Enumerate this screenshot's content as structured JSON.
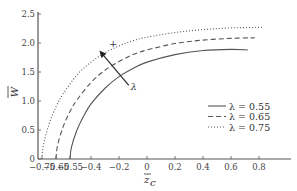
{
  "chart_data": {
    "type": "line",
    "title": "",
    "xlabel": "z̄_c",
    "ylabel": "W̄",
    "xlim": [
      -0.8,
      1.0
    ],
    "ylim": [
      0,
      2.5
    ],
    "x_ticks": [
      -0.75,
      -0.65,
      -0.55,
      -0.4,
      -0.2,
      0,
      0.2,
      0.4,
      0.6,
      0.8
    ],
    "x_tick_labels": [
      "−0.75",
      "−0.65",
      "−0.55",
      "−0.4",
      "−0.2",
      "0",
      "0.2",
      "0.4",
      "0.6",
      "0.8"
    ],
    "y_ticks": [
      0,
      0.5,
      1.0,
      1.5,
      2.0,
      2.5
    ],
    "y_tick_labels": [
      "0",
      "0.5",
      "1.0",
      "1.5",
      "2.0",
      "2.5"
    ],
    "grid": false,
    "legend_position": "lower right",
    "series": [
      {
        "name": "λ = 0.55",
        "style": "solid",
        "x": [
          -0.55,
          -0.54,
          -0.5,
          -0.45,
          -0.4,
          -0.3,
          -0.2,
          -0.1,
          0,
          0.2,
          0.4,
          0.6,
          0.72
        ],
        "y": [
          0,
          0.2,
          0.5,
          0.75,
          0.95,
          1.22,
          1.42,
          1.56,
          1.67,
          1.8,
          1.87,
          1.89,
          1.88
        ]
      },
      {
        "name": "λ = 0.65",
        "style": "dashed",
        "x": [
          -0.65,
          -0.64,
          -0.6,
          -0.55,
          -0.5,
          -0.4,
          -0.3,
          -0.2,
          -0.1,
          0,
          0.2,
          0.4,
          0.6,
          0.77
        ],
        "y": [
          0,
          0.22,
          0.55,
          0.82,
          1.02,
          1.32,
          1.53,
          1.68,
          1.8,
          1.88,
          1.99,
          2.05,
          2.08,
          2.09
        ]
      },
      {
        "name": "λ = 0.75",
        "style": "dotted",
        "x": [
          -0.75,
          -0.74,
          -0.7,
          -0.65,
          -0.6,
          -0.5,
          -0.4,
          -0.3,
          -0.2,
          -0.1,
          0,
          0.2,
          0.4,
          0.6,
          0.82
        ],
        "y": [
          0,
          0.24,
          0.6,
          0.9,
          1.12,
          1.45,
          1.67,
          1.83,
          1.95,
          2.04,
          2.1,
          2.18,
          2.23,
          2.26,
          2.27
        ]
      }
    ],
    "annotations": [
      {
        "type": "arrow",
        "label": "λ",
        "from": [
          -0.13,
          1.27
        ],
        "to": [
          -0.34,
          1.87
        ],
        "note": "increasing λ"
      },
      {
        "type": "text",
        "label": "+",
        "at": [
          -0.27,
          1.93
        ]
      }
    ]
  },
  "legend": {
    "items": [
      {
        "label": "λ = 0.55",
        "style": "solid"
      },
      {
        "label": "λ = 0.65",
        "style": "dashed"
      },
      {
        "label": "λ = 0.75",
        "style": "dotted"
      }
    ]
  },
  "annotation": {
    "arrow_label": "λ",
    "plus_label": "+"
  },
  "axes": {
    "xlabel_main": "z",
    "xlabel_sub": "c",
    "ylabel": "W"
  },
  "colors": {
    "axis": "#555555",
    "line": "#555555",
    "text": "#333333"
  }
}
